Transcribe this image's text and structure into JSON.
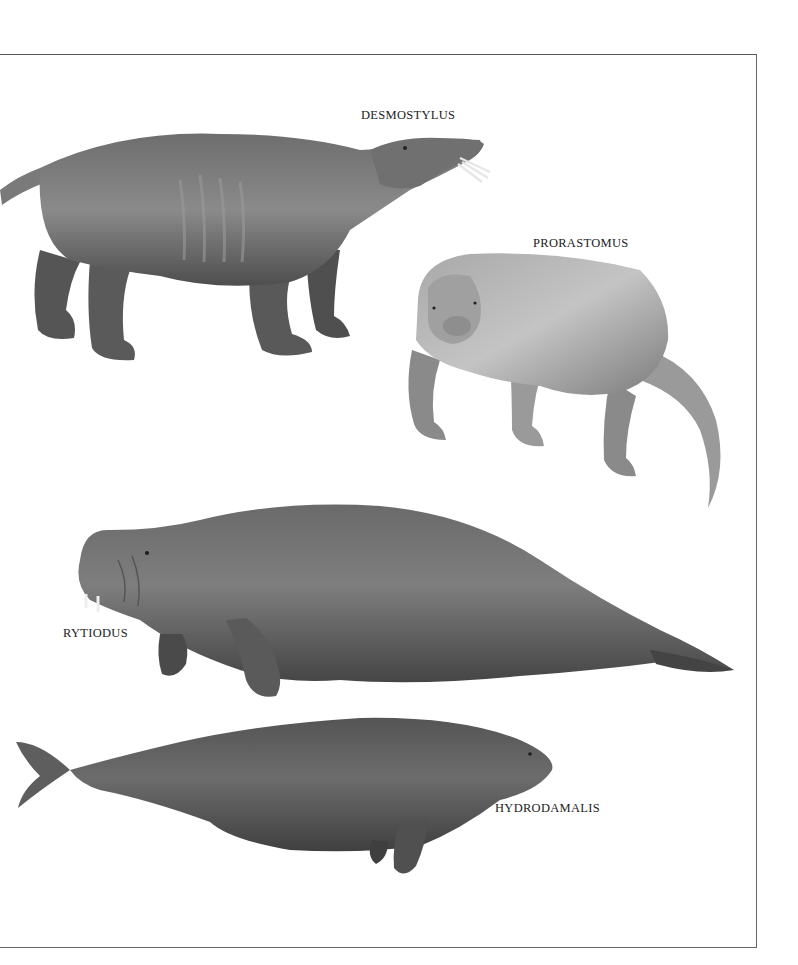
{
  "plate": {
    "labels": {
      "desmostylus": "DESMOSTYLUS",
      "prorastomus": "PRORASTOMUS",
      "rytiodus": "RYTIODUS",
      "hydrodamalis": "HYDRODAMALIS"
    },
    "illustrations": [
      {
        "name": "Desmostylus",
        "depiction": "four-legged hippo-like animal facing right with protruding tusks"
      },
      {
        "name": "Prorastomus",
        "depiction": "stout four-legged animal facing viewer with long tapering tail"
      },
      {
        "name": "Rytiodus",
        "depiction": "large sea cow with tusks, facing left, paddle flippers"
      },
      {
        "name": "Hydrodamalis",
        "depiction": "large sea cow facing right with forked whale-like tail"
      }
    ],
    "colors": {
      "background": "#ffffff",
      "frame": "#555555",
      "label": "#222222",
      "animal_dark": "#4a4a4a",
      "animal_mid": "#7a7a7a",
      "animal_light": "#b5b5b5"
    }
  }
}
